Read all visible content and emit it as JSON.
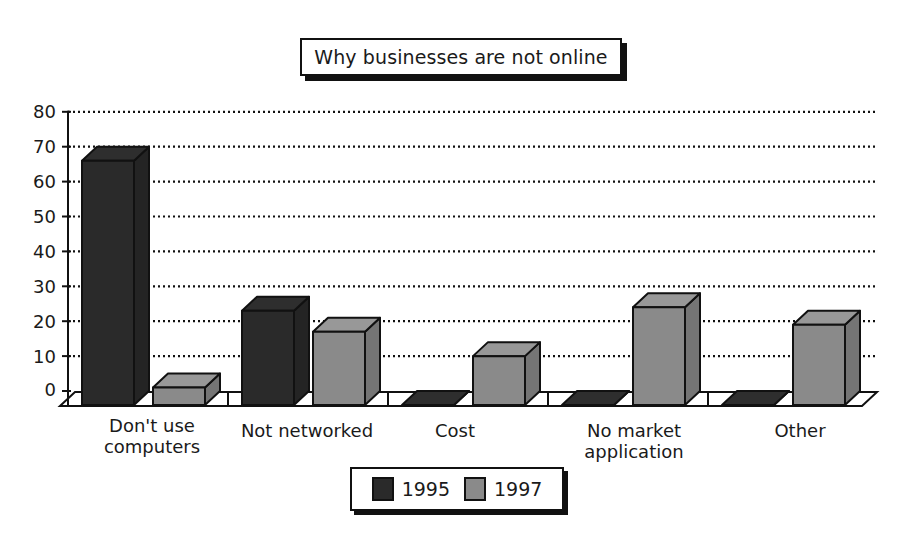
{
  "chart_data": {
    "type": "bar",
    "title": "Why businesses are not online",
    "xlabel": "",
    "ylabel": "",
    "ylim": [
      0,
      80
    ],
    "yticks": [
      0,
      10,
      20,
      30,
      40,
      50,
      60,
      70,
      80
    ],
    "grid": true,
    "grid_style": "dotted horizontal",
    "three_d": true,
    "legend_position": "bottom",
    "categories": [
      "Don't use computers",
      "Not networked",
      "Cost",
      "No market application",
      "Other"
    ],
    "series": [
      {
        "name": "1995",
        "color": "#2a2a2a",
        "values": [
          70,
          27,
          0,
          0,
          0
        ]
      },
      {
        "name": "1997",
        "color": "#8a8a8a",
        "values": [
          5,
          21,
          14,
          28,
          23
        ]
      }
    ]
  },
  "title": "Why businesses are not online",
  "yticks": [
    "80",
    "70",
    "60",
    "50",
    "40",
    "30",
    "20",
    "10",
    "0"
  ],
  "categories": [
    {
      "label": "Don't use\ncomputers"
    },
    {
      "label": "Not networked"
    },
    {
      "label": "Cost"
    },
    {
      "label": "No market\napplication"
    },
    {
      "label": "Other"
    }
  ],
  "legend": [
    {
      "label": "1995",
      "color": "#2a2a2a"
    },
    {
      "label": "1997",
      "color": "#8a8a8a"
    }
  ]
}
